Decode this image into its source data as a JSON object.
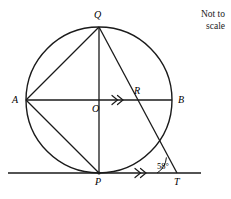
{
  "note": {
    "line1": "Not to",
    "line2": "scale"
  },
  "labels": {
    "Q": "Q",
    "A": "A",
    "B": "B",
    "O": "O",
    "R": "R",
    "P": "P",
    "T": "T"
  },
  "angles": {
    "at_T": "58°"
  },
  "colors": {
    "stroke": "#1a1a1a",
    "background": "#ffffff",
    "text": "#000000"
  },
  "geometry": {
    "circle": {
      "cx": 99,
      "cy": 100,
      "r": 73
    },
    "points": {
      "A": {
        "x": 26,
        "y": 100
      },
      "B": {
        "x": 172,
        "y": 100
      },
      "Q": {
        "x": 99,
        "y": 27
      },
      "P": {
        "x": 99,
        "y": 173
      },
      "O": {
        "x": 99,
        "y": 100
      },
      "R": {
        "x": 137,
        "y": 100
      },
      "T": {
        "x": 177,
        "y": 173
      }
    },
    "segments": [
      {
        "name": "diameter-AB",
        "from": "A",
        "to": "B"
      },
      {
        "name": "diameter-QP",
        "from": "Q",
        "to": "P"
      },
      {
        "name": "chord-AQ",
        "from": "A",
        "to": "Q"
      },
      {
        "name": "chord-AP",
        "from": "A",
        "to": "P"
      },
      {
        "name": "line-QT",
        "from": "Q",
        "to": "T"
      }
    ],
    "tangent_line": {
      "name": "tangent-at-P",
      "x1": 8,
      "x2": 201,
      "y": 173
    },
    "parallel_marks": [
      {
        "name": "parallel-mark-AB",
        "x": 118,
        "y": 100
      },
      {
        "name": "parallel-mark-PT",
        "x": 141,
        "y": 173
      }
    ]
  }
}
